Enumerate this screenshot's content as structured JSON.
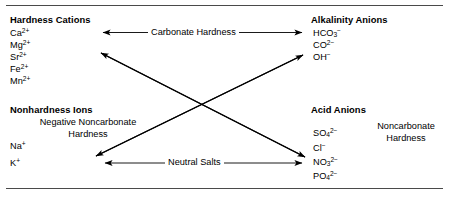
{
  "diagram": {
    "title_alt": "Water hardness and alkalinity ion relationship diagram",
    "frame": {
      "top_rule": "horizontal-rule",
      "bottom_rule": "horizontal-rule",
      "rule_color": "#4a4a4a"
    },
    "quadrants": {
      "top_left": {
        "heading": "Hardness Cations",
        "ions": [
          {
            "formula": "Ca",
            "sub": "",
            "sup": "2+"
          },
          {
            "formula": "Mg",
            "sub": "",
            "sup": "2+"
          },
          {
            "formula": "Sr",
            "sub": "",
            "sup": "2+"
          },
          {
            "formula": "Fe",
            "sub": "",
            "sup": "2+"
          },
          {
            "formula": "Mn",
            "sub": "",
            "sup": "2+"
          }
        ]
      },
      "top_right": {
        "heading": "Alkalinity Anions",
        "ions": [
          {
            "formula": "HCO",
            "sub": "3",
            "sup": "−"
          },
          {
            "formula": "CO",
            "sub": "",
            "sup": "2−"
          },
          {
            "formula": "OH",
            "sub": "",
            "sup": "−"
          }
        ]
      },
      "bottom_left": {
        "heading": "Nonhardness Ions",
        "note_line1": "Negative Noncarbonate",
        "note_line2": "Hardness",
        "ions": [
          {
            "formula": "Na",
            "sub": "",
            "sup": "+"
          },
          {
            "formula": "K",
            "sub": "",
            "sup": "+"
          }
        ]
      },
      "bottom_right": {
        "heading": "Acid Anions",
        "note_line1": "Noncarbonate",
        "note_line2": "Hardness",
        "ions": [
          {
            "formula": "SO",
            "sub": "4",
            "sup": "2−"
          },
          {
            "formula": "Cl",
            "sub": "",
            "sup": "−"
          },
          {
            "formula": "NO",
            "sub": "3",
            "sup": "2−"
          },
          {
            "formula": "PO",
            "sub": "4",
            "sup": "2−"
          }
        ]
      }
    },
    "connectors": [
      {
        "name": "carbonate-hardness",
        "label": "Carbonate Hardness",
        "style": "double-headed-horizontal"
      },
      {
        "name": "neutral-salts",
        "label": "Neutral Salts",
        "style": "double-headed-horizontal"
      },
      {
        "name": "diagonal-cations-to-acid-anions",
        "label": "",
        "style": "double-headed-diagonal"
      },
      {
        "name": "diagonal-nonhardness-to-alkalinity",
        "label": "",
        "style": "double-headed-diagonal"
      }
    ]
  }
}
